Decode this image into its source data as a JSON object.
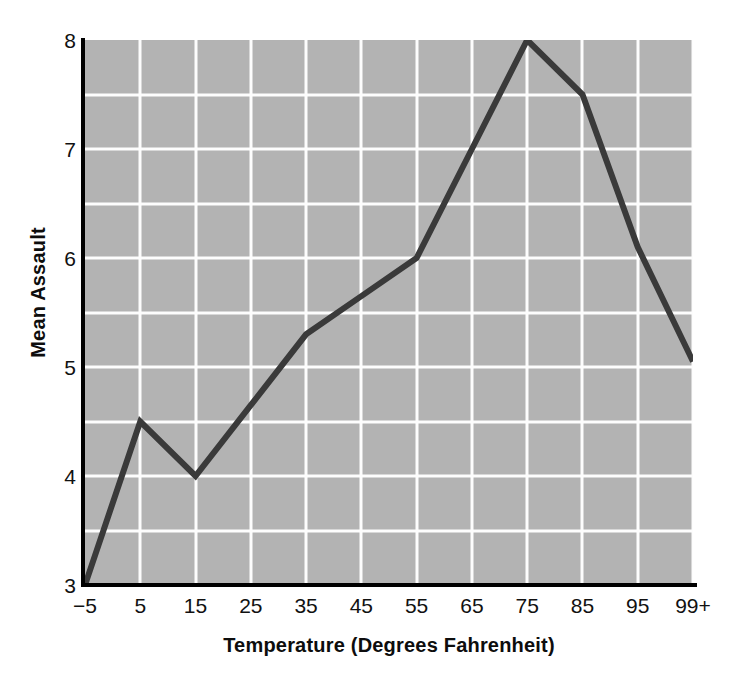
{
  "chart_data": {
    "type": "line",
    "title": "",
    "xlabel": "Temperature (Degrees Fahrenheit)",
    "ylabel": "Mean Assault",
    "categories": [
      "−5",
      "5",
      "15",
      "25",
      "35",
      "45",
      "55",
      "65",
      "75",
      "85",
      "95",
      "99+"
    ],
    "values": [
      3.0,
      4.5,
      4.0,
      4.65,
      5.3,
      5.65,
      6.0,
      7.0,
      8.0,
      7.5,
      6.1,
      5.05
    ],
    "series": [
      {
        "name": "Mean Assault",
        "values": [
          3.0,
          4.5,
          4.0,
          4.65,
          5.3,
          5.65,
          6.0,
          7.0,
          8.0,
          7.5,
          6.1,
          5.05
        ]
      }
    ],
    "ylim": [
      3,
      8
    ],
    "xlim": [
      0,
      11
    ],
    "y_major_ticks": [
      3,
      4,
      5,
      6,
      7,
      8
    ],
    "y_tick_labels": [
      "3",
      "4",
      "5",
      "6",
      "7",
      "8"
    ],
    "y_minor_ticks": [
      3.5,
      4.5,
      5.5,
      6.5,
      7.5
    ],
    "grid": true,
    "legend": "none",
    "plot_background_color": "#b3b3b3",
    "grid_color": "#fdfdfd",
    "line_color": "#3a3a3a",
    "line_width": 6,
    "axis_color": "#000000",
    "page_background_color": "#ffffff"
  }
}
